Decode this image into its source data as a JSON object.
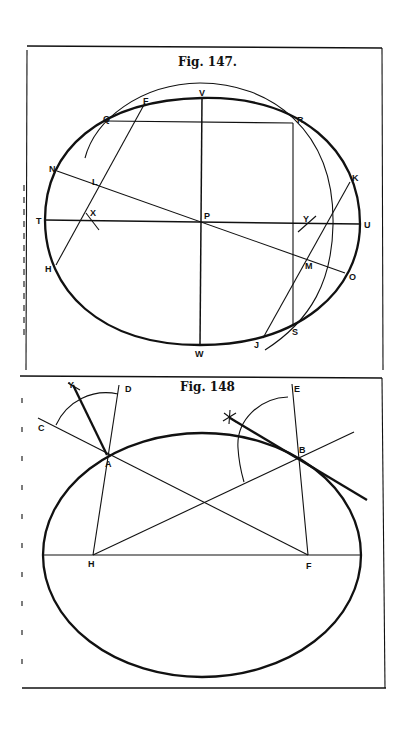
{
  "figures": [
    {
      "id": "fig147",
      "title": "Fig. 147.",
      "labels": {
        "V": "V",
        "F": "F",
        "Q": "Q",
        "R": "R",
        "N": "N",
        "L": "L",
        "K": "K",
        "T": "T",
        "X": "X",
        "P": "P",
        "Y": "Y",
        "U": "U",
        "H": "H",
        "M": "M",
        "O": "O",
        "S": "S",
        "J": "J",
        "W": "W"
      }
    },
    {
      "id": "fig148",
      "title": "Fig. 148",
      "labels": {
        "Y": "Y",
        "D": "D",
        "E": "E",
        "C": "C",
        "A": "A",
        "B": "B",
        "H": "H",
        "F": "F"
      }
    }
  ]
}
